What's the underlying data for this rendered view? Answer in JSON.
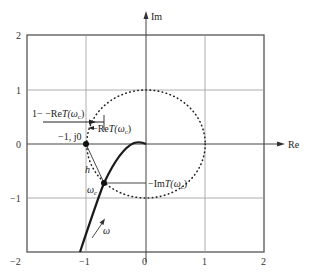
{
  "diagram": {
    "type": "nyquist-plot",
    "axes": {
      "x_label": "Re",
      "y_label": "Im",
      "x_ticks": [
        "−2",
        "−1",
        "0",
        "1",
        "2"
      ],
      "y_ticks": [
        "2",
        "1",
        "0",
        "−1"
      ],
      "xlim": [
        -2,
        2
      ],
      "ylim": [
        -2,
        2
      ]
    },
    "annotations": {
      "critical_point": "−1, j0",
      "distance_label": "1− −Re",
      "distance_label_T": "T",
      "distance_label_arg": "(ω",
      "distance_label_sub": "c",
      "distance_label_close": ")",
      "re_label_prefix": "−Re",
      "re_label_T": "T",
      "re_label_arg": "(ω",
      "re_label_sub": "c",
      "re_label_close": ")",
      "im_label_prefix": "−Im",
      "im_label_T": "T",
      "im_label_arg": "(ω",
      "im_label_sub": "c",
      "im_label_close": ")",
      "h_label": "h",
      "omega_c_label": "ω",
      "omega_c_sub": "c",
      "omega_arrow_label": "ω"
    },
    "elements": {
      "unit_circle": "dotted circle of radius 1 centered at origin",
      "nyquist_curve": "solid thick curve from (−1.1, −2) through ωc (−0.7, −0.72) to origin",
      "crossover_point": {
        "re": -0.7,
        "im": -0.72
      },
      "critical_point_coords": {
        "re": -1,
        "im": 0
      }
    },
    "colors": {
      "axis": "#444444",
      "grid": "#8a8a8a",
      "curve": "#1a1a1a",
      "circle": "#222222"
    }
  }
}
